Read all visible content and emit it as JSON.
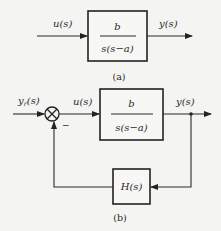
{
  "diagram_a": {
    "input_label": "u(s)",
    "output_label": "y(s)",
    "block": {
      "numerator": "b",
      "denominator": "s(s−a)"
    },
    "caption": "(a)"
  },
  "diagram_b": {
    "reference_label": "y",
    "reference_subscript": "r",
    "reference_suffix": "(s)",
    "control_label": "u(s)",
    "output_label": "y(s)",
    "feedback_sign": "−",
    "forward_block": {
      "numerator": "b",
      "denominator": "s(s−a)"
    },
    "feedback_block": {
      "label": "H(s)"
    },
    "caption": "(b)"
  }
}
